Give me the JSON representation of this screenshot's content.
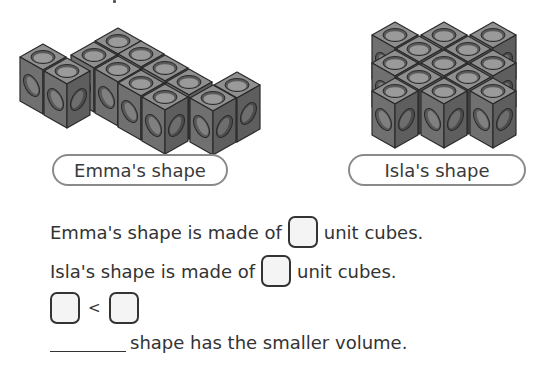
{
  "shapes": [
    {
      "id": "emma",
      "label": "Emma's shape",
      "cube_count_visible": 12
    },
    {
      "id": "isla",
      "label": "Isla's shape",
      "cube_count_visible": 12
    }
  ],
  "questions": {
    "q1": {
      "prefix": "Emma's shape is made of",
      "suffix": "unit cubes."
    },
    "q2": {
      "prefix": "Isla's shape is made of",
      "suffix": "unit cubes."
    },
    "q3": {
      "operator": "<"
    },
    "q4": {
      "suffix": "shape has the smaller volume."
    }
  },
  "colors": {
    "cube_top": "#8d8d8d",
    "cube_left": "#6e6e6e",
    "cube_right": "#5a5a5a",
    "answer_box_fill": "#f4f4f4",
    "label_border": "#8a8a8a"
  }
}
